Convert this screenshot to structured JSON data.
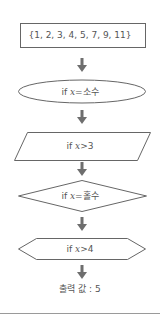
{
  "flowchart": {
    "nodes": [
      {
        "id": "set",
        "shape": "rectangle",
        "text": "{1, 2, 3, 4, 5, 7, 9, 11}"
      },
      {
        "id": "prime",
        "shape": "ellipse",
        "prefix": "if ",
        "var": "x",
        "op": "=",
        "value": "소수"
      },
      {
        "id": "gt3",
        "shape": "parallelogram",
        "prefix": "if ",
        "var": "x",
        "op": ">",
        "value": "3"
      },
      {
        "id": "odd",
        "shape": "diamond",
        "prefix": "if ",
        "var": "x",
        "op": "=",
        "value": "홀수"
      },
      {
        "id": "gt4",
        "shape": "hexagon",
        "prefix": "if ",
        "var": "x",
        "op": ">",
        "value": "4"
      }
    ],
    "output": {
      "label": "출력 값",
      "separator": " : ",
      "value": "5"
    },
    "arrows": [
      "down",
      "down",
      "down",
      "down",
      "down"
    ],
    "colors": {
      "stroke": "#666666",
      "arrow": "#6e6e6e",
      "text": "#555555",
      "rule": "#9a9a9a"
    }
  }
}
